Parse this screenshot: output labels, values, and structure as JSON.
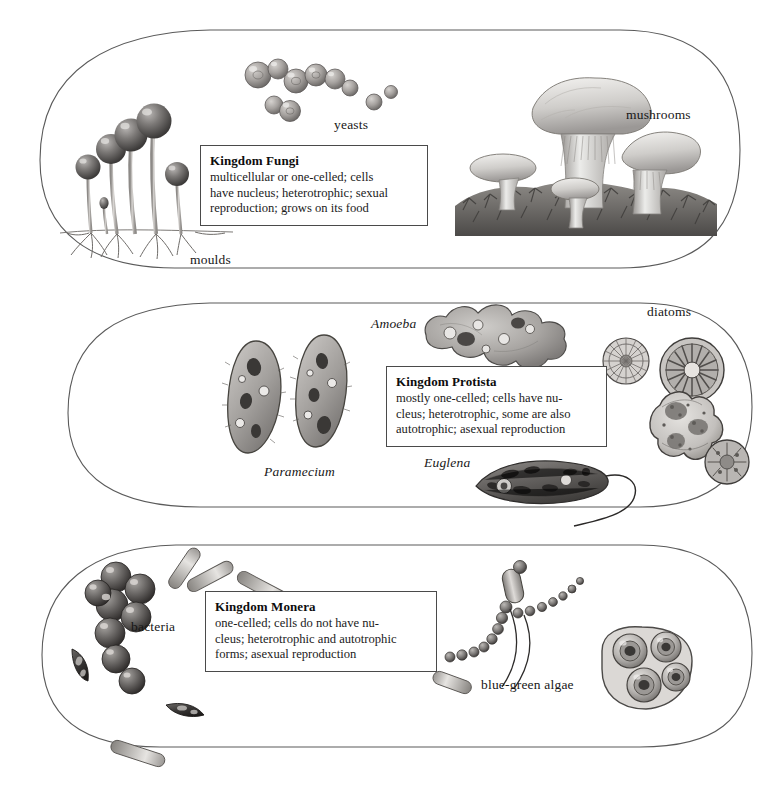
{
  "diagram": {
    "outline_color": "#555555",
    "box_border_color": "#4a4a4a",
    "text_color": "#171717"
  },
  "kingdoms": [
    {
      "id": "fungi",
      "info": {
        "title": "Kingdom Fungi",
        "body": "multicellular or one-celled; cells\nhave nucleus; heterotrophic; sexual\nreproduction; grows on its food"
      },
      "labels": [
        {
          "text": "yeasts",
          "style": "roman"
        },
        {
          "text": "mushrooms",
          "style": "roman"
        },
        {
          "text": "moulds",
          "style": "roman"
        }
      ]
    },
    {
      "id": "protista",
      "info": {
        "title": "Kingdom Protista",
        "body": "mostly one-celled; cells have nu-\ncleus; heterotrophic, some are also\nautotrophic; asexual reproduction"
      },
      "labels": [
        {
          "text": "Amoeba",
          "style": "italic"
        },
        {
          "text": "diatoms",
          "style": "roman"
        },
        {
          "text": "Paramecium",
          "style": "italic"
        },
        {
          "text": "Euglena",
          "style": "italic"
        }
      ]
    },
    {
      "id": "monera",
      "info": {
        "title": "Kingdom Monera",
        "body": "one-celled; cells do not have nu-\ncleus; heterotrophic and autotrophic\nforms; asexual reproduction"
      },
      "labels": [
        {
          "text": "bacteria",
          "style": "roman"
        },
        {
          "text": "blue-green algae",
          "style": "roman"
        }
      ]
    }
  ]
}
